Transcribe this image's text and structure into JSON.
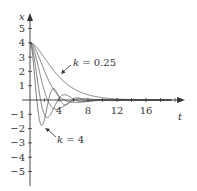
{
  "chart_data": {
    "type": "line",
    "title": "",
    "xlabel": "t",
    "ylabel": "x",
    "xlim": [
      0,
      20.5
    ],
    "ylim": [
      -5.8,
      6
    ],
    "xticks": [
      4,
      8,
      12,
      16
    ],
    "yticks": [
      -5,
      -4,
      -3,
      -2,
      -1,
      1,
      2,
      3,
      4,
      5
    ],
    "grid": false,
    "legend": null,
    "model": "x'' + x' + k x = 0, x(0)=4, x'(0)=0",
    "series": [
      {
        "name": "k = 0.25",
        "k": 0.25
      },
      {
        "name": "k = 0.5",
        "k": 0.5
      },
      {
        "name": "k = 1",
        "k": 1
      },
      {
        "name": "k = 2",
        "k": 2
      },
      {
        "name": "k = 4",
        "k": 4
      }
    ],
    "annotations": [
      {
        "text": "k = 0.25",
        "target_t": 4.4,
        "target_x": 1.9
      },
      {
        "text": "k = 4",
        "target_t": 2.2,
        "target_x": -2.0
      }
    ]
  },
  "labels": {
    "x_axis": "t",
    "y_axis": "x",
    "x_ticks": [
      "4",
      "8",
      "12",
      "16"
    ],
    "y_ticks_pos": [
      "1",
      "2",
      "3",
      "4",
      "5"
    ],
    "y_ticks_neg": [
      "−1",
      "−2",
      "−3",
      "−4",
      "−5"
    ],
    "annot_low": {
      "k": "k",
      "eq": " = 0.25"
    },
    "annot_high": {
      "k": "k",
      "eq": " = 4"
    }
  },
  "colors": {
    "axis": "#333333",
    "curve": "#555555"
  }
}
